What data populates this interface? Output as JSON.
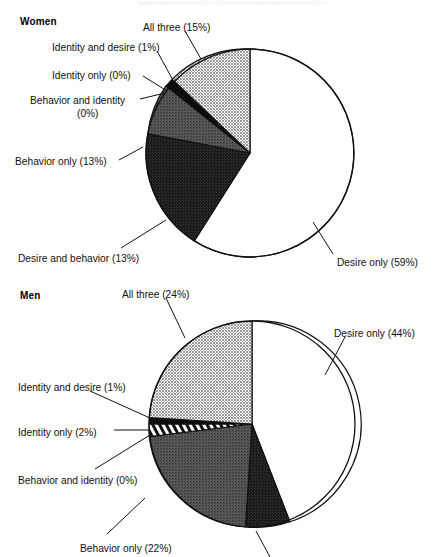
{
  "figure": {
    "background": "#ffffff",
    "width": 436,
    "height": 557,
    "top_artifact": ""
  },
  "panels": [
    {
      "id": "women",
      "title": "Women",
      "title_pos": {
        "x": 20,
        "y": 16
      },
      "center": {
        "x": 250,
        "y": 153
      },
      "radius": 104,
      "labels": [
        {
          "name": "all-three",
          "text": "All three (15%)",
          "x": 143,
          "y": 22,
          "align": "left"
        },
        {
          "name": "identity-and-desire",
          "text": "Identity and desire (1%)",
          "x": 52,
          "y": 42,
          "align": "left"
        },
        {
          "name": "identity-only",
          "text": "Identity only (0%)",
          "x": 52,
          "y": 70,
          "align": "left"
        },
        {
          "name": "behavior-and-identity",
          "text": "Behavior and identity",
          "x": 30,
          "y": 95,
          "align": "left"
        },
        {
          "name": "behavior-and-identity-pct",
          "text": "(0%)",
          "x": 77,
          "y": 108,
          "align": "left"
        },
        {
          "name": "behavior-only",
          "text": "Behavior only (13%)",
          "x": 15,
          "y": 156,
          "align": "left"
        },
        {
          "name": "desire-and-behavior",
          "text": "Desire and behavior (13%)",
          "x": 18,
          "y": 253,
          "align": "left"
        },
        {
          "name": "desire-only",
          "text": "Desire only (59%)",
          "x": 337,
          "y": 257,
          "align": "left"
        }
      ]
    },
    {
      "id": "men",
      "title": "Men",
      "title_pos": {
        "x": 20,
        "y": 290
      },
      "center": {
        "x": 252,
        "y": 424
      },
      "radius": 103,
      "labels": [
        {
          "name": "all-three",
          "text": "All three (24%)",
          "x": 122,
          "y": 289,
          "align": "left"
        },
        {
          "name": "desire-only",
          "text": "Desire only (44%)",
          "x": 334,
          "y": 328,
          "align": "left"
        },
        {
          "name": "identity-and-desire",
          "text": "Identity and desire (1%)",
          "x": 18,
          "y": 382,
          "align": "left"
        },
        {
          "name": "identity-only",
          "text": "Identity only (2%)",
          "x": 18,
          "y": 427,
          "align": "left"
        },
        {
          "name": "behavior-and-identity",
          "text": "Behavior and identity (0%)",
          "x": 18,
          "y": 475,
          "align": "left"
        },
        {
          "name": "behavior-only",
          "text": "Behavior only (22%)",
          "x": 80,
          "y": 543,
          "align": "left"
        }
      ]
    }
  ],
  "chart_data": [
    {
      "type": "pie",
      "title": "Women",
      "start_angle_deg": 0,
      "direction": "clockwise",
      "categories": [
        "Desire only",
        "All three",
        "Identity and desire",
        "Identity only",
        "Behavior and identity",
        "Behavior only",
        "Desire and behavior"
      ],
      "values": [
        59,
        15,
        1,
        0,
        0,
        13,
        13
      ],
      "unit": "%",
      "slice_order_clockwise_from_12": [
        "Desire only",
        "Desire and behavior",
        "Behavior only",
        "Behavior and identity",
        "Identity only",
        "Identity and desire",
        "All three"
      ],
      "fills": [
        "white",
        "dark-dither",
        "mid-dither",
        "black",
        "black",
        "black",
        "light-dither"
      ],
      "legend": "labels-with-leader-lines"
    },
    {
      "type": "pie",
      "title": "Men",
      "start_angle_deg": 0,
      "direction": "clockwise",
      "categories": [
        "Desire only",
        "All three",
        "Behavior only",
        "Identity only",
        "Identity and desire",
        "Behavior and identity",
        "Desire and behavior"
      ],
      "values": [
        44,
        24,
        22,
        2,
        1,
        0,
        7
      ],
      "unit": "%",
      "slice_order_clockwise_from_12": [
        "Desire only",
        "Desire and behavior",
        "Behavior only",
        "Identity only",
        "Behavior and identity",
        "Identity and desire",
        "All three"
      ],
      "fills": [
        "white",
        "dark-dither",
        "mid-dither",
        "white-diagonal-hatch",
        "black",
        "black",
        "light-dither"
      ],
      "legend": "labels-with-leader-lines",
      "note": "Bottom-most label for the dark slice is cropped off the image edge"
    }
  ]
}
